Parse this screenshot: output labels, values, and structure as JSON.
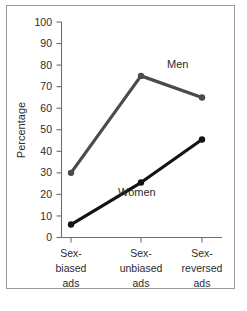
{
  "chart_data": {
    "type": "line",
    "title": "",
    "xlabel": "",
    "ylabel": "Percentage",
    "ylim": [
      0,
      100
    ],
    "ytick_step": 10,
    "yticks": [
      0,
      10,
      20,
      30,
      40,
      50,
      60,
      70,
      80,
      90,
      100
    ],
    "grid": false,
    "legend_position": "inline-annotations",
    "categories": [
      "Sex-biased ads",
      "Sex-unbiased ads",
      "Sex-reversed ads"
    ],
    "category_lines": [
      [
        "Sex-",
        "biased",
        "ads"
      ],
      [
        "Sex-",
        "unbiased",
        "ads"
      ],
      [
        "Sex-",
        "reversed",
        "ads"
      ]
    ],
    "series": [
      {
        "name": "Men",
        "values": [
          30,
          75,
          65
        ],
        "color": "#4b4b4b",
        "marker": "circle"
      },
      {
        "name": "Women",
        "values": [
          6,
          25.5,
          45.5
        ],
        "color": "#141414",
        "marker": "circle"
      }
    ],
    "annotations": [
      {
        "text": "Men",
        "series": "Men",
        "x": 167,
        "y": 68
      },
      {
        "text": "Women",
        "series": "Women",
        "x": 118,
        "y": 196
      }
    ]
  },
  "axis": {
    "y_title": "Percentage",
    "y_tick_labels": [
      "100",
      "90",
      "80",
      "70",
      "60",
      "50",
      "40",
      "30",
      "20",
      "10",
      "0"
    ]
  },
  "colors": {
    "men_line": "#4b4b4b",
    "women_line": "#141414",
    "axis": "#6e6e6e",
    "frame": "#9a9a9a",
    "text": "#2b2b2b",
    "background": "#ffffff"
  }
}
